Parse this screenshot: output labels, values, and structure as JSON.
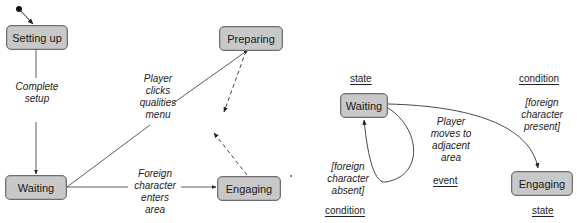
{
  "left_diagram": {
    "states": {
      "setting_up": "Setting up",
      "waiting": "Waiting",
      "preparing": "Preparing",
      "engaging": "Engaging"
    },
    "transitions": {
      "complete_setup": "Complete\nsetup",
      "player_clicks_qualities_menu": "Player\nclicks\nqualities\nmenu",
      "foreign_character_enters_area": "Foreign\ncharacter\nenters\narea"
    }
  },
  "right_diagram": {
    "states": {
      "waiting": "Waiting",
      "engaging": "Engaging"
    },
    "event_label": "Player\nmoves to\nadjacent\narea",
    "condition_present": "[foreign\ncharacter\npresent]",
    "condition_absent": "[foreign\ncharacter\nabsent]",
    "annotations": {
      "state_top": "state",
      "state_bottom": "state",
      "condition_top": "condition",
      "condition_bottom": "condition",
      "event": "event"
    }
  },
  "colors": {
    "state_fill": "#c8c8c8",
    "state_border": "#6e6e6e",
    "line": "#333333"
  }
}
